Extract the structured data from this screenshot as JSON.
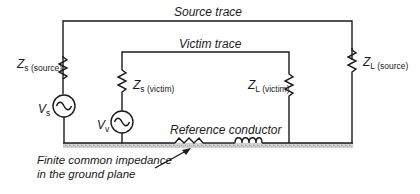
{
  "diagram": {
    "type": "circuit-schematic",
    "labels": {
      "source_trace": "Source trace",
      "victim_trace": "Victim trace",
      "reference_conductor": "Reference conductor",
      "annotation_line1": "Finite common impedance",
      "annotation_line2": "in the ground plane"
    },
    "components": {
      "zs_source": {
        "main": "Z",
        "sub_letter": "s",
        "sub_text": " (source)"
      },
      "zs_victim": {
        "main": "Z",
        "sub_letter": "s",
        "sub_text": " (victim)"
      },
      "zl_source": {
        "main": "Z",
        "sub_letter": "L",
        "sub_text": " (source)"
      },
      "zl_victim": {
        "main": "Z",
        "sub_letter": "L",
        "sub_text": " (victim)"
      },
      "vs": {
        "main": "V",
        "sub_letter": "s"
      },
      "vv": {
        "main": "V",
        "sub_letter": "v"
      }
    },
    "colors": {
      "line": "#1a1a1a",
      "ground_shading": "#c8c8c8",
      "background": "#ffffff"
    }
  }
}
